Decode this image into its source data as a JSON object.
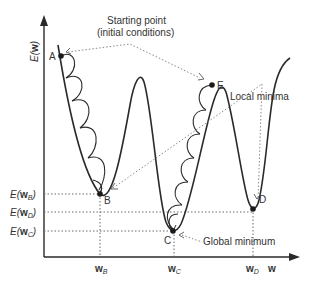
{
  "diagram": {
    "y_axis_label": "E(w)",
    "x_axis_label": "w",
    "annotations": {
      "starting_point_line1": "Starting point",
      "starting_point_line2": "(initial conditions)",
      "local_minima": "Local minima",
      "global_minimum": "Global minimum"
    },
    "points": {
      "A": "A",
      "B": "B",
      "C": "C",
      "D": "D",
      "E": "E"
    },
    "y_ticks": [
      {
        "prefix": "E(",
        "bold": "w",
        "sub": "B",
        "suffix": ")"
      },
      {
        "prefix": "E(",
        "bold": "w",
        "sub": "D",
        "suffix": ")"
      },
      {
        "prefix": "E(",
        "bold": "w",
        "sub": "C",
        "suffix": ")"
      }
    ],
    "x_ticks": [
      {
        "bold": "w",
        "sub": "B"
      },
      {
        "bold": "w",
        "sub": "C"
      },
      {
        "bold": "w",
        "sub": "D"
      }
    ],
    "colors": {
      "curve": "#2a2a2a",
      "dotted_leader": "#8a8a8a",
      "text": "#333333"
    }
  }
}
